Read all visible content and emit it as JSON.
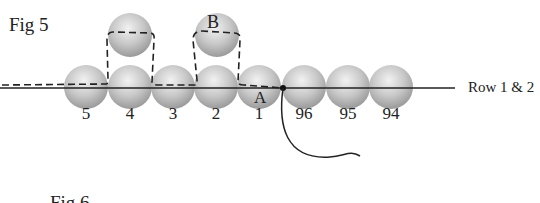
{
  "figure5": {
    "title": "Fig 5",
    "row_label": "Row 1 & 2",
    "point_labels": {
      "a": "A",
      "b": "B"
    },
    "row_beads": [
      {
        "label": "5",
        "x": 86
      },
      {
        "label": "4",
        "x": 130
      },
      {
        "label": "3",
        "x": 173
      },
      {
        "label": "2",
        "x": 216
      },
      {
        "label": "1",
        "x": 259
      },
      {
        "label": "96",
        "x": 304
      },
      {
        "label": "95",
        "x": 348
      },
      {
        "label": "94",
        "x": 391
      }
    ],
    "top_beads": [
      {
        "x": 130
      },
      {
        "x": 217
      }
    ]
  },
  "figure6": {
    "title": "Fig 6"
  },
  "colors": {
    "bead": "#c4c4c4",
    "line": "#222222"
  }
}
